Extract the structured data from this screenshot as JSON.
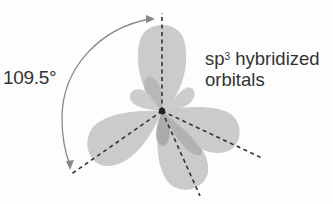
{
  "diagram": {
    "title": "sp3 hybridized orbitals",
    "label_main": "sp",
    "label_sup": "3",
    "label_rest": " hybridized",
    "label_line2": "orbitals",
    "angle_label": "109.5°",
    "orbital_count": 4,
    "colors": {
      "lobe_fill": "#c8c8c8",
      "small_lobe_fill": "#a8a8a8",
      "axis_dash": "#333333",
      "arc": "#888888",
      "text": "#333333"
    }
  }
}
